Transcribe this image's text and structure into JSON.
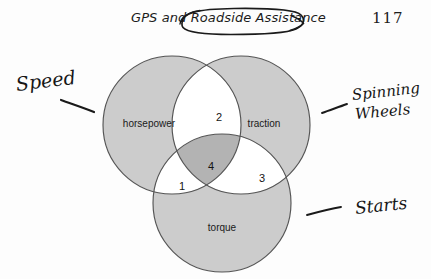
{
  "header": {
    "title": "GPS and Roadside Assistance",
    "circled_phrase": "Roadside Assistance",
    "page_number": "117"
  },
  "diagram": {
    "type": "venn-3-set",
    "sets": [
      {
        "id": "horsepower",
        "label": "horsepower",
        "position": "left",
        "fill": "#cccccc"
      },
      {
        "id": "traction",
        "label": "traction",
        "position": "right",
        "fill": "#cccccc"
      },
      {
        "id": "torque",
        "label": "torque",
        "position": "bottom",
        "fill": "#cccccc"
      }
    ],
    "regions": [
      {
        "id": "horsepower-traction",
        "label": "2",
        "sets": [
          "horsepower",
          "traction"
        ],
        "fill": "#ffffff"
      },
      {
        "id": "horsepower-torque",
        "label": "1",
        "sets": [
          "horsepower",
          "torque"
        ],
        "fill": "#ffffff"
      },
      {
        "id": "traction-torque",
        "label": "3",
        "sets": [
          "traction",
          "torque"
        ],
        "fill": "#ffffff"
      },
      {
        "id": "horsepower-traction-torque",
        "label": "4",
        "sets": [
          "horsepower",
          "traction",
          "torque"
        ],
        "fill": "#b3b3b3"
      }
    ],
    "stroke_color": "#555555"
  },
  "annotations": [
    {
      "id": "speed",
      "text": "Speed",
      "position": "left",
      "has_leader": true
    },
    {
      "id": "spinning-wheels",
      "text": "Spinning",
      "text_line2": "Wheels",
      "position": "right",
      "has_leader": true
    },
    {
      "id": "starts",
      "text": "Starts",
      "position": "bottom-right",
      "has_leader": true
    }
  ],
  "colors": {
    "set_fill": "#cccccc",
    "triple_fill": "#b3b3b3",
    "pair_fill": "#ffffff",
    "outline": "#555555",
    "ink": "#161616"
  }
}
